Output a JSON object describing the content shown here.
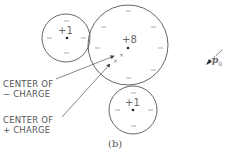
{
  "figure": {
    "caption": "(b)",
    "colors": {
      "stroke": "#555555",
      "text": "#555555",
      "background": "#ffffff"
    },
    "atoms": [
      {
        "id": "left-small",
        "charge_label": "+1",
        "cx": 66,
        "cy": 38,
        "r": 24
      },
      {
        "id": "center-large",
        "charge_label": "+8",
        "cx": 128,
        "cy": 45,
        "r": 40
      },
      {
        "id": "bottom-small",
        "charge_label": "+1",
        "cx": 133,
        "cy": 110,
        "r": 24
      }
    ],
    "labels": {
      "neg_center_line1": "CENTER OF",
      "neg_center_line2": "− CHARGE",
      "pos_center_line1": "CENTER OF",
      "pos_center_line2": "+ CHARGE"
    },
    "dipole": {
      "symbol": "p",
      "subscript": "0"
    },
    "electron_symbol": "−",
    "center_marker": "×"
  }
}
